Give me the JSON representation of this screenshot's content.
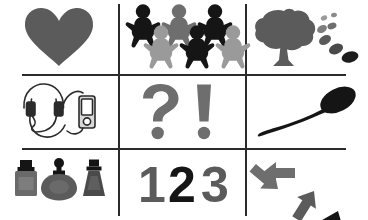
{
  "page": {
    "background_color": "#ffffff",
    "rule_color": "#2b2b2b",
    "rows": 3,
    "columns": 3
  },
  "palette": {
    "black": "#151515",
    "dark_gray": "#3b3b3b",
    "mid_gray": "#5b5b5b",
    "gray": "#6e6e6e",
    "light_gray": "#9a9a9a",
    "pale_gray": "#c4c4c4",
    "white": "#ffffff",
    "outline": "#2b2b2b"
  },
  "cells": [
    {
      "id": "cell-heart",
      "row": 0,
      "column": 0,
      "icon_name": "heart-icon",
      "label": "Heart",
      "color": "#5b5b5b",
      "count": 1
    },
    {
      "id": "cell-gingerbread-people",
      "row": 0,
      "column": 1,
      "icon_name": "gingerbread-people-icon",
      "label": "Six gingerbread people",
      "count": 6,
      "figures": [
        {
          "position": "top-left",
          "color": "#151515"
        },
        {
          "position": "top-center",
          "color": "#6e6e6e"
        },
        {
          "position": "top-right",
          "color": "#151515"
        },
        {
          "position": "bottom-left",
          "color": "#9a9a9a"
        },
        {
          "position": "bottom-center",
          "color": "#151515"
        },
        {
          "position": "bottom-right",
          "color": "#9a9a9a"
        }
      ]
    },
    {
      "id": "cell-tree-leaves",
      "row": 0,
      "column": 2,
      "icon_name": "tree-with-falling-leaves-icon",
      "label": "Tree with falling leaves",
      "tree_color": "#5b5b5b",
      "leaves": [
        {
          "order": 1,
          "color": "#9a9a9a",
          "size": "tiny"
        },
        {
          "order": 2,
          "color": "#8a8a8a",
          "size": "tiny"
        },
        {
          "order": 3,
          "color": "#7d7d7d",
          "size": "small"
        },
        {
          "order": 4,
          "color": "#6e6e6e",
          "size": "medium"
        },
        {
          "order": 5,
          "color": "#5b5b5b",
          "size": "medium"
        },
        {
          "order": 6,
          "color": "#4a4a4a",
          "size": "large"
        },
        {
          "order": 7,
          "color": "#1d1d1d",
          "size": "large"
        }
      ]
    },
    {
      "id": "cell-headphones-player",
      "row": 1,
      "column": 0,
      "icon_name": "headphones-with-music-player-icon",
      "label": "Headphones connected to a music player",
      "outline_color": "#2b2b2b",
      "player_fill": "#d8d8d8"
    },
    {
      "id": "cell-punctuation",
      "row": 1,
      "column": 1,
      "icon_name": "question-and-exclamation-mark-icon",
      "label": "Question mark and exclamation mark",
      "marks": [
        {
          "glyph": "?",
          "color": "#6e6e6e"
        },
        {
          "glyph": "!",
          "color": "#6e6e6e"
        }
      ]
    },
    {
      "id": "cell-spoon",
      "row": 1,
      "column": 2,
      "icon_name": "spoon-icon",
      "label": "Spoon",
      "color": "#151515"
    },
    {
      "id": "cell-perfume-bottles",
      "row": 2,
      "column": 0,
      "icon_name": "perfume-bottles-icon",
      "label": "Three perfume bottles",
      "count": 3,
      "bottles": [
        {
          "shape": "square",
          "body_color": "#6a6a6a",
          "cap_color": "#151515"
        },
        {
          "shape": "round",
          "body_color": "#5b5b5b",
          "cap_color": "#151515"
        },
        {
          "shape": "trapezoid",
          "body_color": "#4a4a4a",
          "cap_color": "#151515"
        }
      ]
    },
    {
      "id": "cell-numbers",
      "row": 2,
      "column": 1,
      "icon_name": "numbers-one-two-three-icon",
      "label": "Numbers one two three",
      "digits": [
        {
          "text": "1",
          "color": "#5b5b5b"
        },
        {
          "text": "2",
          "color": "#151515"
        },
        {
          "text": "3",
          "color": "#5b5b5b"
        }
      ]
    },
    {
      "id": "cell-arrows",
      "row": 2,
      "column": 2,
      "icon_name": "scattered-arrows-icon",
      "label": "Four arrows pointing in different directions",
      "count": 4,
      "arrows": [
        {
          "direction": "left",
          "color": "#6e6e6e"
        },
        {
          "direction": "up-right",
          "color": "#5b5b5b"
        },
        {
          "direction": "down-right",
          "color": "#6e6e6e"
        },
        {
          "direction": "up-left",
          "color": "#151515"
        }
      ]
    }
  ]
}
